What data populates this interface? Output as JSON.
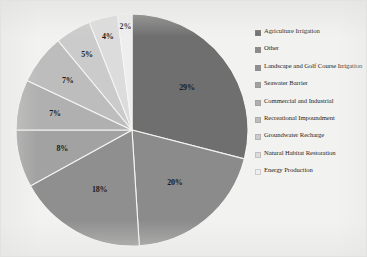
{
  "figure": {
    "background_color": "#f2f2f0",
    "border_color": "#e2e2e0"
  },
  "chart_data": {
    "type": "pie",
    "title": "",
    "subtitle": "",
    "xlabel": "",
    "ylabel": "",
    "grid": false,
    "legend_position": "right",
    "start_angle_deg": 0,
    "direction": "clockwise",
    "categories": [
      "Agriculture Irrigation",
      "Other",
      "Landscape and Golf Course Irrigation",
      "Seawater Barrier",
      "Commercial and Industrial",
      "Recreational Impoundment",
      "Groundwater Recharge",
      "Natural Habitat Restoration",
      "Energy Production"
    ],
    "values": [
      29,
      20,
      18,
      8,
      7,
      7,
      5,
      4,
      2
    ],
    "value_labels": [
      "29%",
      "20%",
      "18%",
      "8%",
      "7%",
      "7%",
      "5%",
      "4%",
      "2%"
    ],
    "colors": [
      "#6f6f6f",
      "#8b8b8b",
      "#8f8f8f",
      "#a2a2a2",
      "#b0b0b0",
      "#bdbdbd",
      "#cbcbcb",
      "#dcdcdc",
      "#eeeeee"
    ],
    "slice_border_color": "#f5f5f3"
  },
  "legend": {
    "items": [
      {
        "label": "Agriculture Irrigation",
        "color": "#6f6f6f"
      },
      {
        "label": "Other",
        "color": "#8b8b8b"
      },
      {
        "label": "Landscape and Golf Course Irrigation",
        "color": "#8f8f8f"
      },
      {
        "label": "Seawater Barrier",
        "color": "#a2a2a2"
      },
      {
        "label": "Commercial and Industrial",
        "color": "#b0b0b0"
      },
      {
        "label": "Recreational Impoundment",
        "color": "#bdbdbd"
      },
      {
        "label": "Groundwater Recharge",
        "color": "#cbcbcb"
      },
      {
        "label": "Natural Habitat Restoration",
        "color": "#dcdcdc"
      },
      {
        "label": "Energy Production",
        "color": "#eeeeee"
      }
    ]
  }
}
